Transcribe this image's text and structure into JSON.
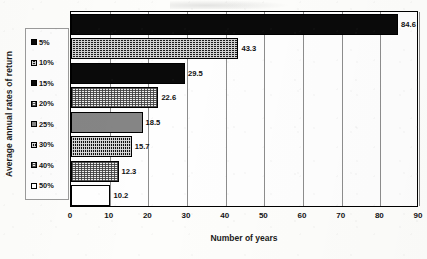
{
  "chart_data": {
    "type": "bar",
    "orientation": "horizontal",
    "title": "",
    "xlabel": "Number of years",
    "ylabel": "Average annual rates of return",
    "categories": [
      "5%",
      "10%",
      "15%",
      "20%",
      "25%",
      "30%",
      "40%",
      "50%"
    ],
    "values": [
      84.6,
      43.3,
      29.5,
      22.6,
      18.5,
      15.7,
      12.3,
      10.2
    ],
    "value_labels": [
      "84.6",
      "43.3",
      "29.5",
      "22.6",
      "18.5",
      "15.7",
      "12.3",
      "10.2"
    ],
    "xlim": [
      0,
      90
    ],
    "xticks": [
      0,
      10,
      20,
      30,
      40,
      50,
      60,
      70,
      80,
      90
    ],
    "xtick_labels": [
      "0",
      "10",
      "20",
      "30",
      "40",
      "50",
      "60",
      "70",
      "80",
      "90"
    ],
    "grid": true,
    "grid_axis": "x",
    "legend_position": "left-outside",
    "series_name": "Number of years",
    "bar_fills": [
      "solid-black",
      "dark-dots",
      "solid-black",
      "light-dots",
      "solid-gray",
      "dense-crosshatch",
      "light-dots",
      "white"
    ]
  },
  "legend": {
    "items": [
      {
        "label": "5%",
        "fill": "solid-black"
      },
      {
        "label": "10%",
        "fill": "dark-dots"
      },
      {
        "label": "15%",
        "fill": "solid-black"
      },
      {
        "label": "20%",
        "fill": "light-dots"
      },
      {
        "label": "25%",
        "fill": "solid-gray"
      },
      {
        "label": "30%",
        "fill": "dense-crosshatch"
      },
      {
        "label": "40%",
        "fill": "light-dots"
      },
      {
        "label": "50%",
        "fill": "white"
      }
    ]
  },
  "colors": {
    "bar_black": "#0a0a0a",
    "bar_gray": "#858585",
    "bar_white": "#ffffff",
    "axis": "#000000",
    "gridline": "#8d8d8d",
    "text": "#141414",
    "page_background": "#fdfdfb"
  }
}
